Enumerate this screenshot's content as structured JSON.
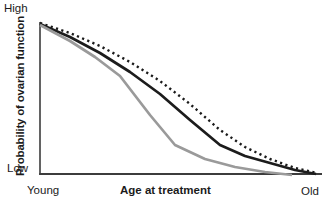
{
  "chart_data": {
    "type": "line",
    "title": "",
    "xlabel": "Age at treatment",
    "ylabel": "Probability of ovarian function",
    "x_axis": {
      "min_label": "Young",
      "max_label": "Old",
      "ticks": "none",
      "range_norm": [
        0,
        1
      ]
    },
    "y_axis": {
      "min_label": "Low",
      "max_label": "High",
      "ticks": "none",
      "range_norm": [
        0,
        1
      ]
    },
    "grid": false,
    "legend": "none",
    "axis_color": "#3c3c3c",
    "series": [
      {
        "name": "dotted-black-curve",
        "style": "dotted",
        "color": "#1a1a1a",
        "stroke_width": 2.4,
        "points_norm": [
          [
            0,
            1.0
          ],
          [
            0.107,
            0.934
          ],
          [
            0.214,
            0.848
          ],
          [
            0.321,
            0.742
          ],
          [
            0.429,
            0.616
          ],
          [
            0.536,
            0.464
          ],
          [
            0.643,
            0.291
          ],
          [
            0.732,
            0.179
          ],
          [
            0.821,
            0.099
          ],
          [
            0.911,
            0.04
          ],
          [
            0.989,
            0.007
          ]
        ],
        "points_px": [
          [
            40,
            23
          ],
          [
            70,
            33
          ],
          [
            100,
            46
          ],
          [
            130,
            62
          ],
          [
            160,
            81
          ],
          [
            190,
            104
          ],
          [
            220,
            130
          ],
          [
            245,
            147
          ],
          [
            270,
            159
          ],
          [
            295,
            168
          ],
          [
            317,
            173
          ]
        ]
      },
      {
        "name": "solid-black-curve",
        "style": "solid",
        "color": "#1c1c1c",
        "stroke_width": 2.7,
        "points_norm": [
          [
            0,
            0.993
          ],
          [
            0.107,
            0.907
          ],
          [
            0.214,
            0.801
          ],
          [
            0.321,
            0.675
          ],
          [
            0.429,
            0.53
          ],
          [
            0.536,
            0.358
          ],
          [
            0.643,
            0.192
          ],
          [
            0.732,
            0.119
          ],
          [
            0.821,
            0.073
          ],
          [
            0.911,
            0.026
          ],
          [
            0.986,
            0.0
          ]
        ],
        "points_px": [
          [
            40,
            24
          ],
          [
            70,
            37
          ],
          [
            100,
            53
          ],
          [
            130,
            72
          ],
          [
            160,
            94
          ],
          [
            190,
            120
          ],
          [
            220,
            145
          ],
          [
            245,
            156
          ],
          [
            270,
            163
          ],
          [
            295,
            170
          ],
          [
            316,
            174
          ]
        ]
      },
      {
        "name": "solid-gray-curve",
        "style": "solid",
        "color": "#9a9a9a",
        "stroke_width": 2.7,
        "points_norm": [
          [
            0,
            0.987
          ],
          [
            0.107,
            0.881
          ],
          [
            0.196,
            0.775
          ],
          [
            0.286,
            0.649
          ],
          [
            0.393,
            0.391
          ],
          [
            0.482,
            0.192
          ],
          [
            0.589,
            0.099
          ],
          [
            0.696,
            0.046
          ],
          [
            0.804,
            0.013
          ],
          [
            0.9,
            0.0
          ]
        ],
        "points_px": [
          [
            40,
            25
          ],
          [
            70,
            41
          ],
          [
            95,
            57
          ],
          [
            120,
            76
          ],
          [
            150,
            115
          ],
          [
            175,
            145
          ],
          [
            205,
            159
          ],
          [
            235,
            167
          ],
          [
            265,
            172
          ],
          [
            292,
            175
          ]
        ]
      }
    ]
  }
}
